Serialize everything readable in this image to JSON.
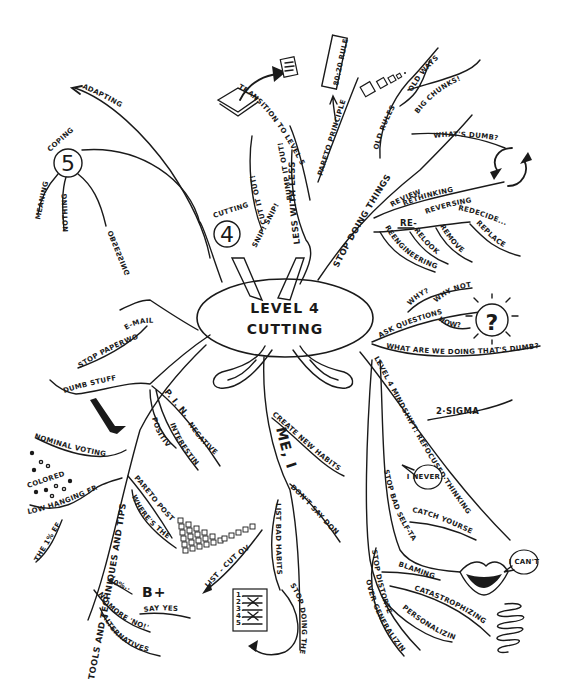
{
  "center": {
    "line1": "LEVEL 4",
    "line2": "CUTTING",
    "snip": "SNIP! SNIP!"
  },
  "level_transition": {
    "label": "TRANSITION TO LEVEL 5",
    "node4_caption": "CUTTING",
    "node4_number": "4",
    "node5_caption": "COPING",
    "node5_number": "5",
    "node5_children": [
      "MEANING",
      "NOTHING",
      "OBSESSING"
    ],
    "adapting": "ADAPTING"
  },
  "less_with_less": {
    "label": "LESS WITH LESS",
    "children": [
      "CUT IT OUT!",
      "BUMP IT OUT!"
    ],
    "pareto": "PARETO PRINCIPLE",
    "rule_box": "80:20 RULE"
  },
  "stop_doing_things": {
    "label": "STOP DOING THINGS",
    "old_rules": "OLD RULES",
    "old_ways": "OLD WAYS",
    "big_chunks": "BIG CHUNKS!",
    "whats_dumb": "WHAT'S DUMB?",
    "re_prefix": "RE-",
    "re_items": [
      "REVIEW",
      "RETHINKING",
      "REVERSING",
      "REDECIDE...",
      "REENGINEERING",
      "RELOOK",
      "REMOVE",
      "REPLACE"
    ]
  },
  "ask_questions": {
    "label": "ASK QUESTIONS",
    "children": [
      "WHY?",
      "WHY NOT?",
      "HOW?"
    ],
    "what_are_we": "WHAT ARE WE DOING THAT'S DUMB?"
  },
  "mindshift": {
    "label": "LEVEL 4 MINDSHIFT: REFOCUSED THINKING",
    "sigma": "2·SIGMA",
    "stop_bad_self_talk": "STOP BAD SELF-TALK",
    "i_never": "I NEVER...",
    "catch_yourself": "CATCH YOURSELF",
    "i_cant": "I CAN'T",
    "stop_distorted": "STOP DISTORTED THINKING",
    "distortions": [
      "BLAMING",
      "CATASTROPHIZING",
      "PERSONALIZING",
      "OVER-GENERALIZING"
    ]
  },
  "me_inc": {
    "label": "ME, INC.",
    "create": "CREATE NEW HABITS",
    "dont_say": "DON'T SAY DON'T",
    "list_bad_habits": "LIST BAD HABITS",
    "stop_doing_them": "STOP DOING THEM",
    "list_items": [
      "1.",
      "2.",
      "3.",
      "4.",
      "5."
    ]
  },
  "left_branch": {
    "email": "E-MAIL",
    "stop_paperwork": "STOP PAPERWORK",
    "dumb_stuff": "DUMB STUFF!",
    "pin": "P. I. N.",
    "pin_children": [
      "POSITIVE",
      "INTERESTING",
      "NEGATIVE"
    ]
  },
  "tools": {
    "label": "TOOLS AND TECHNIQUES AND TIPS",
    "nominal_voting": "NOMINAL VOTING",
    "colored_dots": "COLORED DOTS",
    "low_hanging": "LOW HANGING FRUIT / TRAIL",
    "the_effect": "THE 1% EFFECT",
    "pareto_post_its": "PARETO POST-ITS",
    "where_waste": "WHERE'S THE WASTE?",
    "list_cut": "LIST - CUT OVER TIME",
    "percent": "80%...",
    "grade": "B+",
    "say_yes": "SAY YES!",
    "no_more_no": "NO MORE 'NO!'",
    "alternatives": "ALTERNATIVES"
  }
}
